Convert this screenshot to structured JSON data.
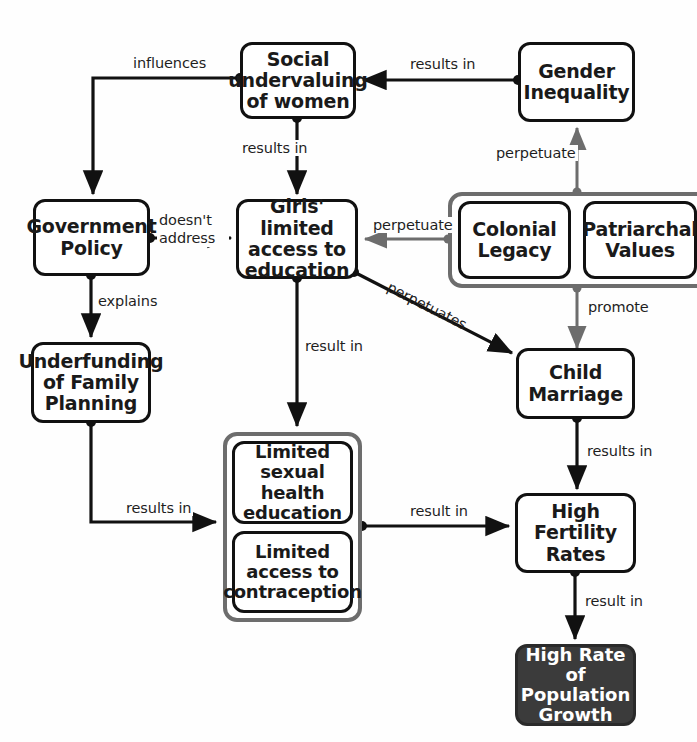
{
  "diagram": {
    "colors": {
      "node_border": "#111111",
      "node_fill": "#ffffff",
      "group_border": "#6d6d6d",
      "dark_node_fill": "#3b3b3b",
      "dark_node_text": "#ffffff",
      "edge_dark": "#111111",
      "edge_gray": "#6d6d6d",
      "background": "#fefefe"
    },
    "nodes": [
      {
        "id": "social_undervaluing",
        "label": "Social undervaluing of women"
      },
      {
        "id": "gender_inequality",
        "label": "Gender Inequality"
      },
      {
        "id": "government_policy",
        "label": "Government Policy"
      },
      {
        "id": "girls_education",
        "label": "Girls' limited access to education"
      },
      {
        "id": "colonial_legacy",
        "label": "Colonial Legacy"
      },
      {
        "id": "patriarchal_values",
        "label": "Patriarchal Values"
      },
      {
        "id": "underfunding",
        "label": "Underfunding of Family Planning"
      },
      {
        "id": "child_marriage",
        "label": "Child Marriage"
      },
      {
        "id": "limited_sex_ed",
        "label": "Limited sexual health education"
      },
      {
        "id": "limited_contraception",
        "label": "Limited access to contraception"
      },
      {
        "id": "high_fertility",
        "label": "High Fertility Rates"
      },
      {
        "id": "population_growth",
        "label": "High Rate of Population Growth"
      }
    ],
    "edge_labels": {
      "influences": "influences",
      "results_in_gender": "results in",
      "results_in_social": "results in",
      "perpetuate_gender": "perpetuate",
      "doesnt_address": "doesn't address",
      "perpetuate_girls": "perpetuate",
      "explains": "explains",
      "perpetuates_marriage": "perpetuates",
      "promote": "promote",
      "result_in_sexed": "result in",
      "results_in_underfunding": "results in",
      "results_in_marriage": "results in",
      "result_in_fertility": "result in",
      "result_in_population": "result in"
    }
  }
}
